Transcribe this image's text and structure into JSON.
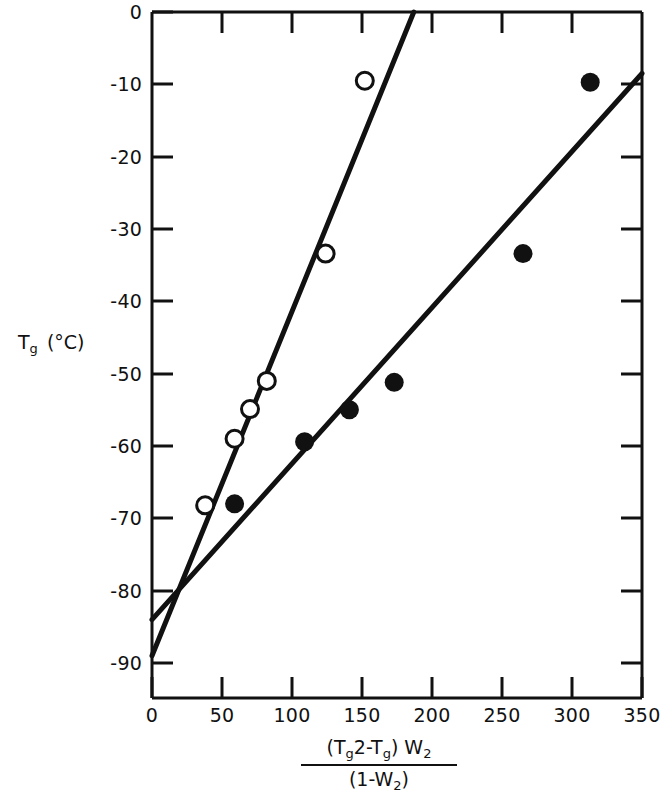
{
  "chart_data": {
    "type": "scatter",
    "title": "",
    "subtitle": "",
    "xlabel": "(Tg2-Tg) W2 / (1-W2)",
    "ylabel": "Tg (°C)",
    "xlim": [
      0,
      350
    ],
    "ylim": [
      -90,
      0
    ],
    "grid": false,
    "legend_position": "none",
    "x_ticks": [
      0,
      50,
      100,
      150,
      200,
      250,
      300,
      350
    ],
    "x_tick_labels": [
      "0",
      "50",
      "100",
      "150",
      "200",
      "250",
      "300",
      "350"
    ],
    "y_ticks": [
      0,
      -10,
      -20,
      -30,
      -40,
      -50,
      -60,
      -70,
      -80,
      -90
    ],
    "y_tick_labels": [
      "0",
      "-10",
      "-20",
      "-30",
      "-40",
      "-50",
      "-60",
      "-70",
      "-80",
      "-90"
    ],
    "series": [
      {
        "name": "open-circles",
        "marker": "open-circle",
        "points": [
          {
            "x": 38,
            "y": -68.2
          },
          {
            "x": 59,
            "y": -59.0
          },
          {
            "x": 70,
            "y": -54.9
          },
          {
            "x": 82,
            "y": -51.0
          },
          {
            "x": 124,
            "y": -33.4
          },
          {
            "x": 152,
            "y": -9.5
          }
        ],
        "fit_line": {
          "x0": 0,
          "y0": -89.0,
          "x1": 187,
          "y1": 0.0
        }
      },
      {
        "name": "filled-circles",
        "marker": "filled-circle",
        "points": [
          {
            "x": 59,
            "y": -68.0
          },
          {
            "x": 109,
            "y": -59.4
          },
          {
            "x": 141,
            "y": -55.0
          },
          {
            "x": 173,
            "y": -51.2
          },
          {
            "x": 265,
            "y": -33.4
          },
          {
            "x": 313,
            "y": -9.7
          }
        ],
        "fit_line": {
          "x0": 0,
          "y0": -84.0,
          "x1": 350,
          "y1": -8.5
        }
      }
    ]
  },
  "axis": {
    "y_title": {
      "symbol": "T",
      "subscript": "g",
      "unit": "(°C)"
    },
    "x_title": {
      "numerator_part1": "(T",
      "numerator_sub1": "g",
      "numerator_part2": "2",
      "numerator_part3": "-T",
      "numerator_sub2": "g",
      "numerator_part4": ") W",
      "numerator_sub3": "2",
      "denominator_part1": "(1-W",
      "denominator_sub1": "2",
      "denominator_part2": ")"
    }
  },
  "style": {
    "axis_color": "#111111",
    "line_color": "#111111",
    "marker_fill": "#111111",
    "marker_open_fill": "#ffffff",
    "background": "#ffffff"
  }
}
